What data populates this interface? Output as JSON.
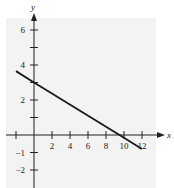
{
  "chart_data": {
    "type": "line",
    "title": "",
    "xlabel": "x",
    "ylabel": "y",
    "xlim": [
      -3,
      14
    ],
    "ylim": [
      -3,
      7
    ],
    "grid": false,
    "legend": null,
    "x_ticks": [
      2,
      4,
      6,
      8,
      10,
      12
    ],
    "x_tick_labels": [
      "2",
      "4",
      "6",
      "8",
      "10",
      "12"
    ],
    "y_ticks": [
      -2,
      -1,
      2,
      4,
      6
    ],
    "y_tick_labels": [
      "-2",
      "-1",
      "2",
      "4",
      "6"
    ],
    "y_minor_ticks": [
      1,
      3,
      5
    ],
    "x_minor_ticks": [
      -2
    ],
    "series": [
      {
        "name": "line",
        "x": [
          -2,
          0,
          9.5,
          12
        ],
        "y": [
          3.65,
          3.0,
          0.0,
          -0.8
        ],
        "color": "#1a1a1a"
      }
    ],
    "annotations": {
      "y_intercept": 3,
      "x_intercept": 9.5
    },
    "panel_color": "#f3f3f3"
  }
}
